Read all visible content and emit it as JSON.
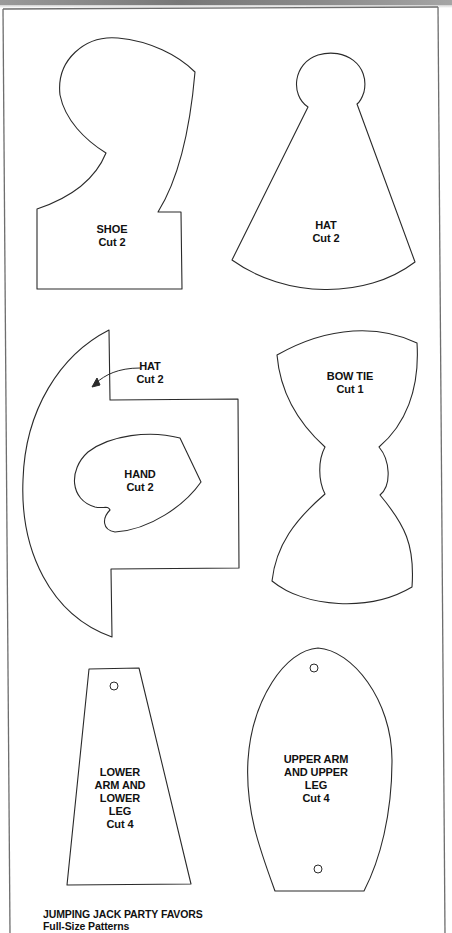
{
  "document": {
    "title": "JUMPING JACK PARTY FAVORS",
    "subtitle": "Full-Size Patterns"
  },
  "patterns": {
    "shoe": {
      "name": "SHOE",
      "cut": "Cut 2"
    },
    "hat": {
      "name": "HAT",
      "cut": "Cut 2"
    },
    "hat_brim": {
      "name": "HAT",
      "cut": "Cut 2"
    },
    "hand": {
      "name": "HAND",
      "cut": "Cut 2"
    },
    "bow_tie": {
      "name": "BOW TIE",
      "cut": "Cut 1"
    },
    "lower_arm": {
      "line1": "LOWER",
      "line2": "ARM AND",
      "line3": "LOWER",
      "line4": "LEG",
      "cut": "Cut 4"
    },
    "upper_arm": {
      "line1": "UPPER ARM",
      "line2": "AND UPPER",
      "line3": "LEG",
      "cut": "Cut 4"
    }
  },
  "colors": {
    "line": "#2a2a2a",
    "frame": "#6b6b6b",
    "paper": "#ffffff"
  }
}
